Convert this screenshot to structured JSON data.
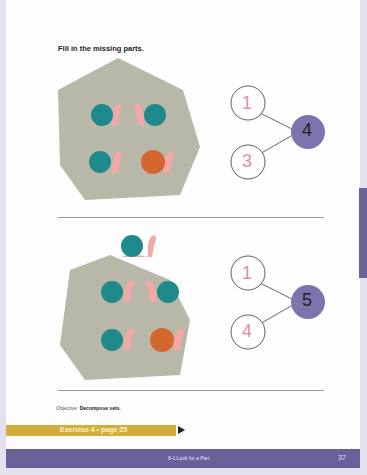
{
  "page": {
    "instruction": "Fill in the missing parts.",
    "problems": [
      {
        "shell_colors": [
          "teal",
          "teal",
          "teal",
          "orange"
        ],
        "snail_count": 4,
        "part1": "1",
        "part2": "3",
        "whole": "4"
      },
      {
        "shell_colors": [
          "teal",
          "teal",
          "teal",
          "teal",
          "orange"
        ],
        "snail_count": 5,
        "part1": "1",
        "part2": "4",
        "whole": "5"
      }
    ],
    "objective_label": "Objective:",
    "objective_text": "Decompose sets.",
    "exercise_label": "Exercise 4 • page 25",
    "footer_title": "8-1  Look for a Part",
    "page_number": "37"
  },
  "colors": {
    "rock": "#b8b8a8",
    "teal_shell": "#1f8a8c",
    "orange_shell": "#d3672e",
    "snail_body": "#f2a8a6",
    "whole_circle": "#7b74ad",
    "part_digit": "#e88da0",
    "footer": "#68619a",
    "exercise_bar": "#d4ae3c"
  }
}
